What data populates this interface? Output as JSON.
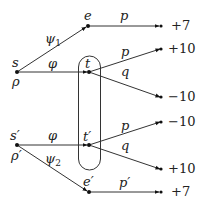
{
  "diagram": {
    "type": "game-tree",
    "nodes": {
      "s": {
        "label": "s",
        "sublabel": "ρ"
      },
      "e": {
        "label": "e"
      },
      "t": {
        "label": "t"
      },
      "s_prime": {
        "label": "s′",
        "sublabel": "ρ′"
      },
      "t_prime": {
        "label": "t′"
      },
      "e_prime": {
        "label": "e′"
      }
    },
    "edges": {
      "s_e": {
        "label": "ψ1",
        "label_base": "ψ",
        "label_sub": "1"
      },
      "s_t": {
        "label": "φ"
      },
      "e_end": {
        "label": "p"
      },
      "t_up": {
        "label": "p"
      },
      "t_down": {
        "label": "q"
      },
      "sp_tp": {
        "label": "φ"
      },
      "sp_ep": {
        "label": "ψ2",
        "label_base": "ψ",
        "label_sub": "2"
      },
      "tp_up": {
        "label": "p"
      },
      "tp_down": {
        "label": "q"
      },
      "ep_end": {
        "label": "p′"
      }
    },
    "payoffs": {
      "e_end": "+7",
      "t_up": "+10",
      "t_down": "−10",
      "tp_up": "−10",
      "tp_down": "+10",
      "ep_end": "+7"
    },
    "information_set": {
      "members": [
        "t",
        "t′"
      ]
    }
  }
}
